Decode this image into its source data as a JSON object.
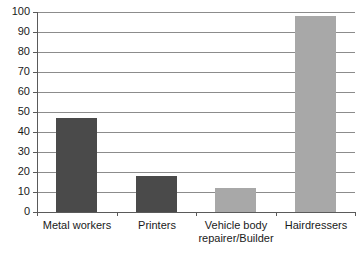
{
  "chart_data": {
    "type": "bar",
    "title": "",
    "subtitle": "",
    "xlabel": "",
    "ylabel": "",
    "categories": [
      "Metal workers",
      "Vehicle body\nrepairer/Builder",
      "Printers",
      "Hairdressers"
    ],
    "category_labels": [
      "Metal workers",
      "Printers",
      "Vehicle body\nrepairer/Builder",
      "Hairdressers"
    ],
    "values": [
      47,
      18,
      12,
      98
    ],
    "bar_colors": [
      "#4a4a4a",
      "#4a4a4a",
      "#a8a8a8",
      "#a8a8a8"
    ],
    "ylim": [
      0,
      100
    ],
    "ytick_values": [
      0,
      10,
      20,
      30,
      40,
      50,
      60,
      70,
      80,
      90,
      100
    ],
    "ytick_labels": [
      "0",
      "10",
      "20",
      "30",
      "40",
      "50",
      "60",
      "70",
      "80",
      "90",
      "100"
    ],
    "grid": true,
    "legend": null,
    "legend_position": "none",
    "annotations": []
  },
  "axis_colors": {
    "gridline": "#8c8c8c",
    "axis_line": "#5a5a5a",
    "tick_text": "#1a1a1a",
    "background": "#ffffff"
  }
}
